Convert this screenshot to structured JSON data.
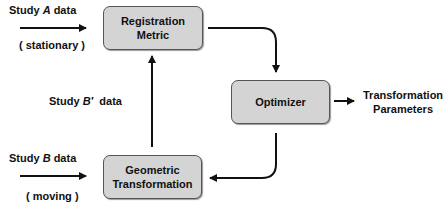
{
  "diagram": {
    "nodes": {
      "registration_metric": {
        "line1": "Registration",
        "line2": "Metric"
      },
      "optimizer": {
        "label": "Optimizer"
      },
      "geometric_transformation": {
        "line1": "Geometric",
        "line2": "Transformation"
      }
    },
    "labels": {
      "study_a": {
        "prefix": "Study ",
        "var": "A",
        "suffix": " data"
      },
      "stationary": "( stationary )",
      "study_b_prime": {
        "prefix": "Study ",
        "var": "B′",
        "suffix": "  data"
      },
      "study_b": {
        "prefix": "Study ",
        "var": "B",
        "suffix": " data"
      },
      "moving": "( moving )",
      "output": {
        "line1": "Transformation",
        "line2": "Parameters"
      }
    }
  }
}
